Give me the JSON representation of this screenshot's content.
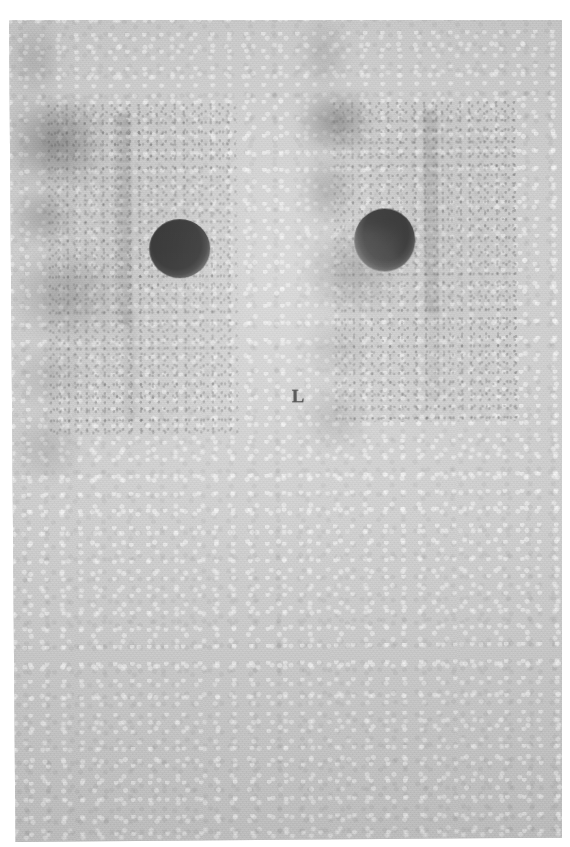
{
  "image": {
    "modality": "planar scintigraphy",
    "view": "posterior whole-body",
    "orientation_marker": "L",
    "background_color": "#cdcdcd",
    "film_color": "#cccccc",
    "paper_color": "#ffffff",
    "hot_focus_color": "#070707",
    "width": 570,
    "height": 847
  },
  "markers": {
    "left_marker_label": "L"
  },
  "panels": [
    {
      "id": "left-panel",
      "side_label": "left-image-panel",
      "findings": [
        {
          "name": "intense-focal-uptake",
          "x": 177,
          "y": 240,
          "rx": 30,
          "ry": 29,
          "intensity": "very-high"
        },
        {
          "name": "diffuse-soft-tissue-uptake",
          "x": 96,
          "y": 243,
          "rx": 46,
          "ry": 42,
          "intensity": "moderate"
        },
        {
          "name": "vertebral-column-uptake",
          "x": 122,
          "y": 210,
          "width": 16,
          "height": 205,
          "intensity": "low"
        },
        {
          "name": "pelvic-uptake",
          "x": 150,
          "y": 345,
          "rx": 52,
          "ry": 46,
          "intensity": "low"
        },
        {
          "name": "shoulder-region-uptake",
          "x": 212,
          "y": 160,
          "rx": 26,
          "ry": 40,
          "intensity": "very-low"
        }
      ]
    },
    {
      "id": "right-panel",
      "side_label": "right-image-panel",
      "findings": [
        {
          "name": "intense-focal-uptake",
          "x": 373,
          "y": 234,
          "rx": 30,
          "ry": 31,
          "intensity": "very-high"
        },
        {
          "name": "adjacent-moderate-uptake",
          "x": 459,
          "y": 245,
          "rx": 35,
          "ry": 30,
          "intensity": "moderate"
        },
        {
          "name": "vertebral-column-uptake",
          "x": 420,
          "y": 205,
          "width": 14,
          "height": 195,
          "intensity": "low"
        },
        {
          "name": "pelvic-uptake",
          "x": 424,
          "y": 330,
          "rx": 48,
          "ry": 42,
          "intensity": "low"
        },
        {
          "name": "shoulder-region-uptake",
          "x": 470,
          "y": 170,
          "rx": 24,
          "ry": 36,
          "intensity": "very-low"
        }
      ]
    }
  ]
}
